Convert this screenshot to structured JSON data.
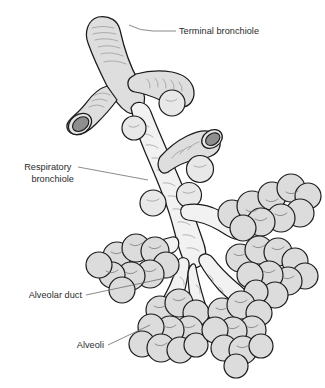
{
  "figure": {
    "background_color": "#ffffff",
    "line_color": "#1b1b1b",
    "leader_color": "#6d6d6d",
    "text_color": "#2b2b2b",
    "airway_fill": "#dedede",
    "alveolus_fill": "#dcdcdc",
    "lumen_color": "#8e8e8e"
  },
  "labels": [
    {
      "id": "terminal-bronchiole",
      "lines": [
        "Terminal bronchiole"
      ],
      "text": "Terminal bronchiole",
      "x": 179,
      "y": 34,
      "anchor": "start"
    },
    {
      "id": "respiratory-bronchiole",
      "lines": [
        "Respiratory",
        "bronchiole"
      ],
      "text": "Respiratory bronchiole",
      "x": 74,
      "y": 170,
      "anchor": "end"
    },
    {
      "id": "alveolar-duct",
      "lines": [
        "Alveolar duct"
      ],
      "text": "Alveolar duct",
      "x": 82,
      "y": 298,
      "anchor": "end"
    },
    {
      "id": "alveoli",
      "lines": [
        "Alveoli"
      ],
      "text": "Alveoli",
      "x": 104,
      "y": 348,
      "anchor": "end"
    }
  ]
}
